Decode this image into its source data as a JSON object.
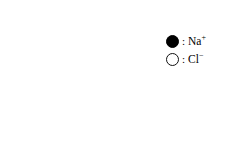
{
  "figure": {
    "type": "crystal-lattice-diagram",
    "compound": "NaCl",
    "projection": "oblique",
    "grid_divisions": 3,
    "lattice_points_per_edge": 3
  },
  "geometry": {
    "front_origin_x": 24,
    "front_origin_y": 42,
    "cell_step_x": 43,
    "cell_step_y": 43.5,
    "depth_step_x": 13.5,
    "depth_step_y": -12,
    "layers": 3,
    "radius_front": 7.6,
    "radius_mid": 7.0,
    "radius_back": 6.4,
    "line_color": "#6f6f6f",
    "line_color_dark": "#3a3a3a",
    "line_width": 1.15
  },
  "ions": {
    "cation": {
      "name": "Na",
      "charge": "+",
      "label": "Na",
      "superscript": "+",
      "fill": "#000000",
      "stroke": "#000000",
      "style": "filled"
    },
    "anion": {
      "name": "Cl",
      "charge": "-",
      "label": "Cl",
      "superscript": "−",
      "fill": "#ffffff",
      "stroke": "#111111",
      "style": "hollow"
    }
  },
  "legend": {
    "separator": ":",
    "rows": [
      {
        "swatch": "filled-circle",
        "separator": ":",
        "label": "Na",
        "superscript": "+",
        "ion": "sodium-cation"
      },
      {
        "swatch": "hollow-circle",
        "separator": ":",
        "label": "Cl",
        "superscript": "−",
        "ion": "chloride-anion"
      }
    ]
  },
  "colors": {
    "background": "#ffffff",
    "foreground": "#000000",
    "bond_line": "#6f6f6f"
  }
}
